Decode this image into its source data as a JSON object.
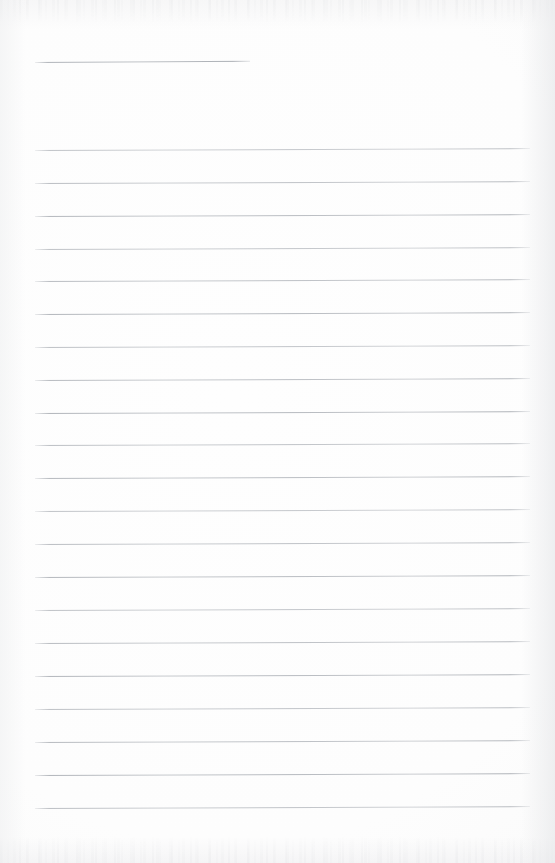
{
  "document": {
    "kind": "scanned-lined-page",
    "title": "Blank ruled page",
    "orientation": "portrait",
    "page_width": 555,
    "page_height": 863,
    "background_color": "#fdfdfd",
    "rule_color": "#aeb2b8",
    "edge_shadow_color": "#e9eaec",
    "visible_text": "",
    "header_rule": {
      "label": "header-rule",
      "x": 35,
      "y": 62,
      "width": 215,
      "slant_deg": -0.35
    },
    "body_rules": {
      "label": "ruled-lines",
      "count": 21,
      "first_y": 150,
      "spacing": 32.9,
      "x_start": 35,
      "x_end": 530,
      "slant_deg": -0.22,
      "y_positions": [
        150,
        183,
        216,
        249,
        281,
        314,
        347,
        380,
        413,
        445,
        478,
        511,
        544,
        577,
        610,
        643,
        676,
        709,
        742,
        775,
        808
      ]
    },
    "scan_artifacts": {
      "top_noise_band": {
        "label": "top-edge-scan-noise",
        "y": 0,
        "height": 22
      },
      "bottom_noise_band": {
        "label": "bottom-edge-scan-noise",
        "y": 837,
        "height": 26
      },
      "right_edge_shadow": {
        "label": "right-page-edge-shadow",
        "x": 521,
        "width": 34
      }
    }
  }
}
